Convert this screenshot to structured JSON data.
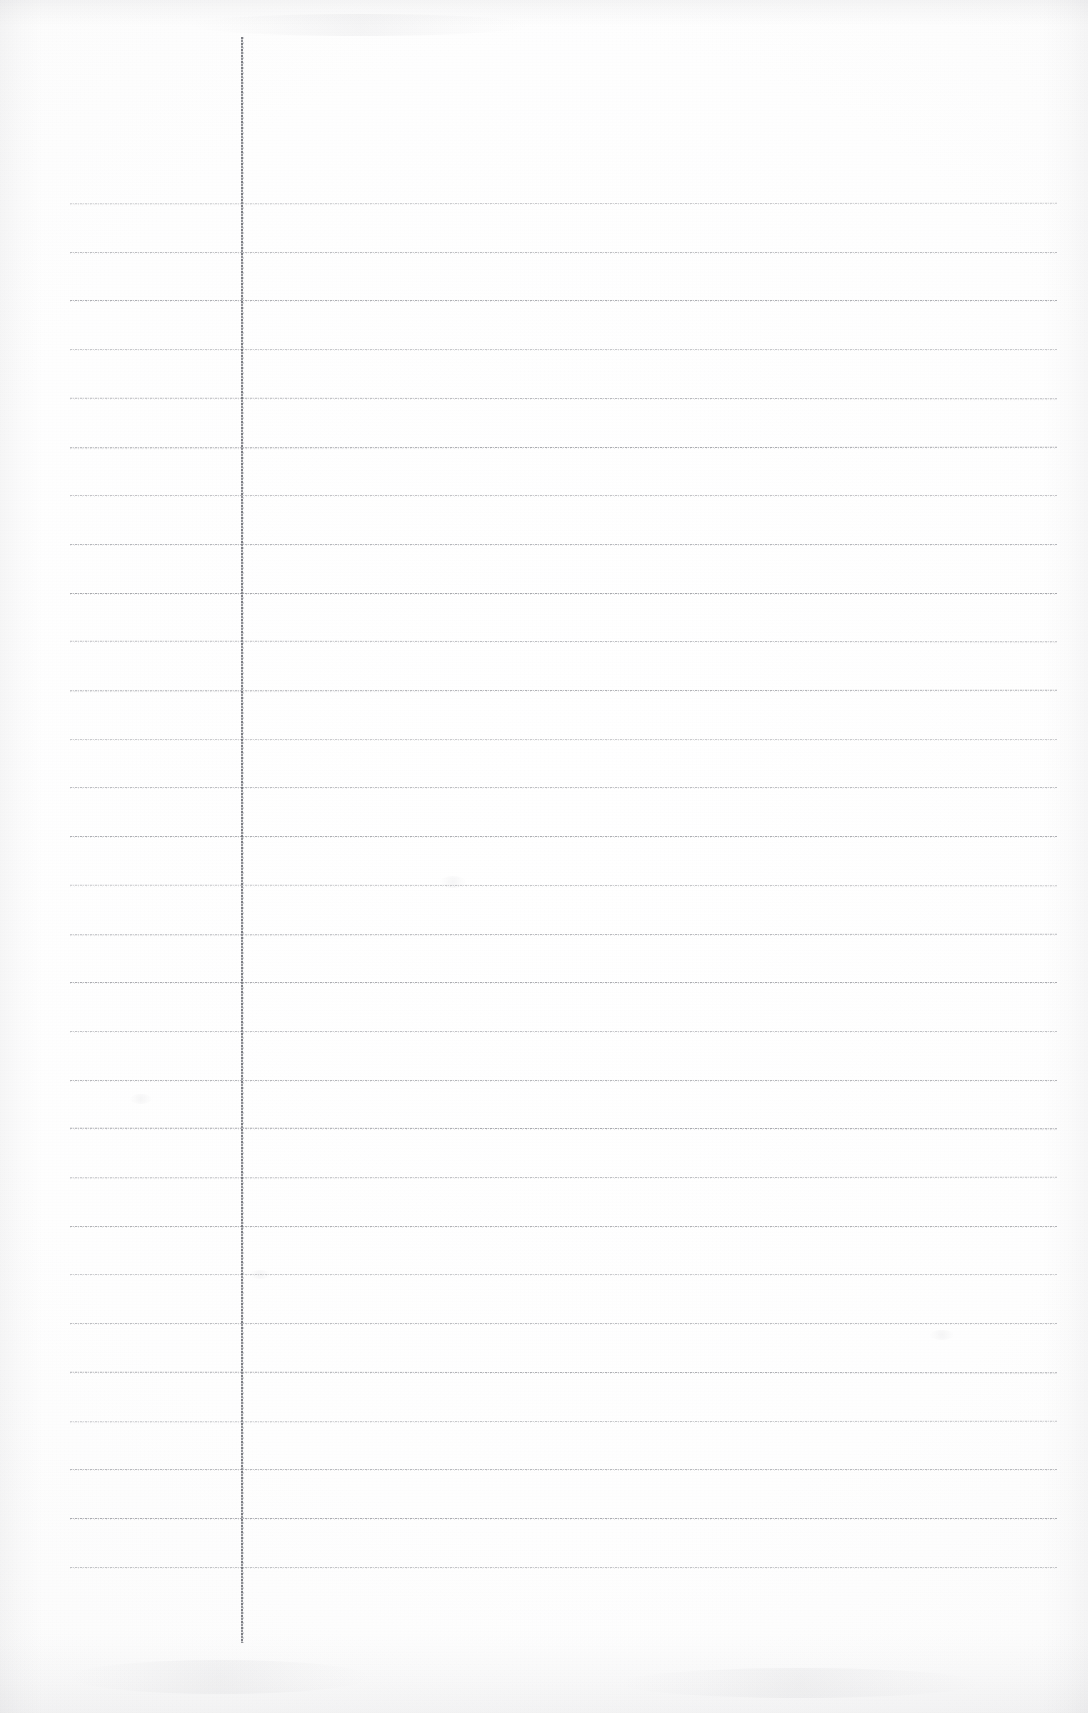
{
  "document": {
    "type": "scanned-ruled-notebook-page",
    "title": "Blank ruled notebook page",
    "orientation": "portrait",
    "page_width": 1088,
    "page_height": 1713,
    "paper_color": "#fdfdfd",
    "rule_color": "#6c6e76",
    "margin_rule_color": "#5c5e66",
    "handwritten_text": "",
    "printed_text": "",
    "header_text": "",
    "footer_text": "",
    "page_number": ""
  },
  "ruling": {
    "horizontal_rule_count": 29,
    "first_rule_y": 203,
    "rule_spacing": 48.7,
    "rule_left_x": 70,
    "rule_right_x": 1057,
    "rule_thickness": 1,
    "margin_rule_x": 241,
    "margin_rule_top_y": 37,
    "margin_rule_bottom_y": 1643,
    "margin_rule_thickness": 2,
    "rule_style": "dotted-faint"
  },
  "scan_artifacts": {
    "blotches": [
      {
        "x": 440,
        "y": 876,
        "w": 26,
        "h": 12
      },
      {
        "x": 130,
        "y": 1094,
        "w": 22,
        "h": 10
      },
      {
        "x": 250,
        "y": 1270,
        "w": 20,
        "h": 9
      },
      {
        "x": 930,
        "y": 1330,
        "w": 24,
        "h": 10
      },
      {
        "x": 70,
        "y": 1660,
        "w": 300,
        "h": 34
      },
      {
        "x": 620,
        "y": 1668,
        "w": 360,
        "h": 30
      },
      {
        "x": 190,
        "y": 14,
        "w": 340,
        "h": 22
      }
    ],
    "edge_shading": true,
    "grain": true
  }
}
